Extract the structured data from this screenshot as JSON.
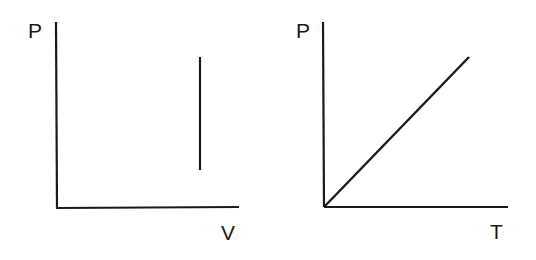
{
  "diagrams": [
    {
      "id": "pv",
      "y_label": "P",
      "x_label": "V",
      "description": "Vertical line (isochoric process) on P-V axes"
    },
    {
      "id": "pt",
      "y_label": "P",
      "x_label": "T",
      "description": "Straight line through origin on P-T axes"
    }
  ],
  "colors": {
    "line": "#1a1a1a",
    "background": "#ffffff"
  }
}
